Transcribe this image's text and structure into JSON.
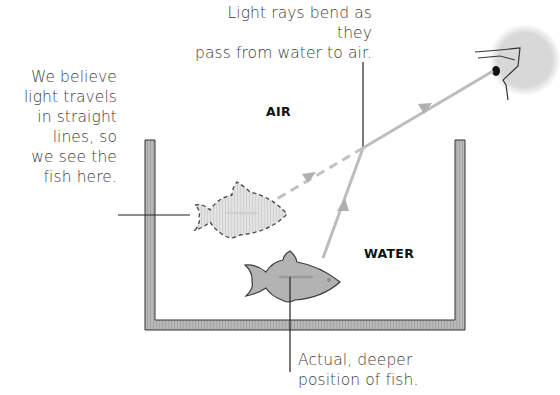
{
  "diagram": {
    "labels": {
      "top_callout": [
        "Light rays bend as they",
        "pass from water to air."
      ],
      "left_callout": [
        "We believe",
        "light travels",
        "in straight",
        "lines, so",
        "we see the",
        "fish here."
      ],
      "bottom_callout": [
        "Actual, deeper",
        "position of fish."
      ],
      "air": "AIR",
      "water": "WATER"
    },
    "elements": {
      "tank": "water-tank",
      "apparent_fish": "apparent-fish-dashed-outline",
      "actual_fish": "actual-fish",
      "eye": "observer-eye-icon",
      "refracted_ray": "light-ray-solid",
      "apparent_ray": "light-ray-dashed"
    },
    "colors": {
      "tank_wall": "#a9a9a9",
      "ray": "#b5b5b5",
      "fish": "#b3b3b3",
      "apparent_fish": "#e4e4e4",
      "text": "#3d3d3d",
      "face": "#dcdcdc"
    }
  }
}
